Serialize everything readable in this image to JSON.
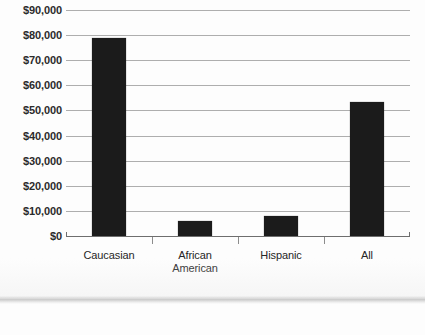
{
  "chart_data": {
    "type": "bar",
    "title": "",
    "subtitle": "",
    "xlabel": "",
    "ylabel": "",
    "categories": [
      "Caucasian",
      "African American",
      "Hispanic",
      "All"
    ],
    "category_lines": [
      [
        "Caucasian"
      ],
      [
        "African",
        "American"
      ],
      [
        "Hispanic"
      ],
      [
        "All"
      ]
    ],
    "values": [
      79000,
      6000,
      8000,
      53500
    ],
    "value_labels": [
      "$79,000",
      "$6,000",
      "$8,000",
      "$53,500"
    ],
    "ylim": [
      0,
      90000
    ],
    "ytick_step": 10000,
    "ytick_values": [
      90000,
      80000,
      70000,
      60000,
      50000,
      40000,
      30000,
      20000,
      10000,
      0
    ],
    "ytick_labels": [
      "$90,000",
      "$80,000",
      "$70,000",
      "$60,000",
      "$50,000",
      "$40,000",
      "$30,000",
      "$20,000",
      "$10,000",
      "$0"
    ],
    "grid": true,
    "grid_axis": "y",
    "legend": false,
    "legend_position": "none",
    "bar_color": "#1b1b1b",
    "gridline_color": "#9a9a9a",
    "axis_color": "#6e6e6e",
    "label_color": "#2b2b2b",
    "background": "#fdfdfd"
  }
}
